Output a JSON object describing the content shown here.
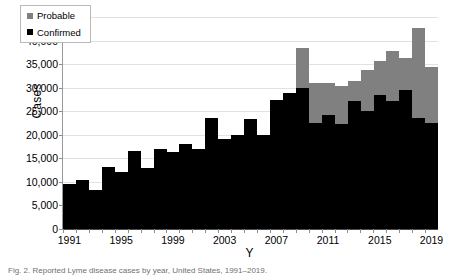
{
  "chart_data": {
    "type": "bar",
    "stacked": true,
    "title": "",
    "xlabel": "Y",
    "ylabel": "Cases",
    "ylim": [
      0,
      45000
    ],
    "ytick_step": 5000,
    "ytick_labels": [
      "45,000",
      "40,000",
      "35,000",
      "30,000",
      "25,000",
      "20,000",
      "15,000",
      "10,000",
      "5,000",
      "0"
    ],
    "ytick_values": [
      45000,
      40000,
      35000,
      30000,
      25000,
      20000,
      15000,
      10000,
      5000,
      0
    ],
    "grid": true,
    "grid_axis": "y",
    "legend_position": "top-left-inside",
    "categories": [
      "1991",
      "1992",
      "1993",
      "1994",
      "1995",
      "1996",
      "1997",
      "1998",
      "1999",
      "2000",
      "2001",
      "2002",
      "2003",
      "2004",
      "2005",
      "2006",
      "2007",
      "2008",
      "2009",
      "2010",
      "2011",
      "2012",
      "2013",
      "2014",
      "2015",
      "2016",
      "2017",
      "2018",
      "2019"
    ],
    "xtick_labels": [
      "1991",
      "1995",
      "1999",
      "2003",
      "2007",
      "2011",
      "2015",
      "2019"
    ],
    "series": [
      {
        "name": "Confirmed",
        "color": "#000000",
        "values": [
          9500,
          10400,
          8300,
          13100,
          12000,
          16500,
          13000,
          17000,
          16400,
          18000,
          17000,
          23600,
          19200,
          20000,
          23300,
          19900,
          27400,
          28900,
          29900,
          22500,
          24300,
          22300,
          27200,
          25000,
          28500,
          27200,
          29500,
          23500,
          22600
        ]
      },
      {
        "name": "Probable",
        "color": "#808080",
        "values": [
          0,
          0,
          0,
          0,
          0,
          0,
          0,
          0,
          0,
          0,
          0,
          0,
          0,
          0,
          0,
          0,
          0,
          0,
          8600,
          8400,
          6600,
          8100,
          4300,
          8800,
          7200,
          10500,
          6800,
          19200,
          11700
        ]
      }
    ],
    "totals": [
      9500,
      10400,
      8300,
      13100,
      12000,
      16500,
      13000,
      17000,
      16400,
      18000,
      17000,
      23600,
      19200,
      20000,
      23300,
      19900,
      27400,
      28900,
      38500,
      30900,
      30900,
      30400,
      31500,
      33800,
      35700,
      37700,
      36300,
      42700,
      34300
    ]
  },
  "legend": {
    "items": [
      {
        "label": "Probable"
      },
      {
        "label": "Confirmed"
      }
    ]
  },
  "caption": {
    "text": "Fig. 2.   Reported Lyme disease cases by year, United States, 1991–2019."
  }
}
